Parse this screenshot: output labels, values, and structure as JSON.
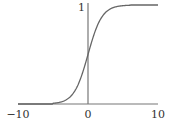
{
  "chart_data": {
    "type": "line",
    "title": "",
    "xlabel": "",
    "ylabel": "",
    "xlim": [
      -10,
      10
    ],
    "ylim": [
      0,
      1
    ],
    "grid": false,
    "legend": "none",
    "x_ticks": [
      {
        "value": -10,
        "label": "−10"
      },
      {
        "value": 0,
        "label": "0"
      },
      {
        "value": 10,
        "label": "10"
      }
    ],
    "y_ticks": [
      {
        "value": 1,
        "label": "1"
      }
    ],
    "series": [
      {
        "name": "sigmoid",
        "function": "1/(1+exp(-x))",
        "x": [
          -10,
          -8,
          -6,
          -5,
          -4,
          -3,
          -2,
          -1,
          0,
          1,
          2,
          3,
          4,
          5,
          6,
          8,
          10
        ],
        "y": [
          0.0,
          0.0,
          0.0,
          0.007,
          0.018,
          0.047,
          0.119,
          0.269,
          0.5,
          0.731,
          0.881,
          0.953,
          0.982,
          0.993,
          1.0,
          1.0,
          1.0
        ]
      }
    ]
  }
}
